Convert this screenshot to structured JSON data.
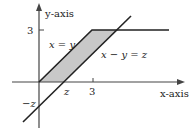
{
  "diagram": {
    "axes": {
      "x_label": "x-axis",
      "y_label": "y-axis",
      "x_tick_3": "3",
      "x_tick_z": "z",
      "y_tick_3": "3",
      "y_tick_neg_z": "−z"
    },
    "lines": {
      "diagonal_xy": "x = y",
      "diagonal_xminusy": "x − y = z"
    },
    "colors": {
      "line": "#222222",
      "shade": "#c8c8c8"
    }
  }
}
